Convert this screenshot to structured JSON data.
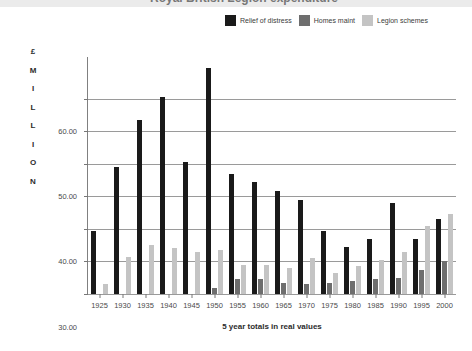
{
  "title": {
    "text": "Royal British Legion expenditure",
    "clipped": true
  },
  "legend": {
    "position": "top-right",
    "items": [
      {
        "label": "Relief of distress",
        "color": "#1a1a1a",
        "swatch_name": "legend-swatch-relief-of-distress"
      },
      {
        "label": "Homes maint",
        "color": "#6e6e6e",
        "swatch_name": "legend-swatch-homes-maint"
      },
      {
        "label": "Legion schemes",
        "color": "#c4c4c4",
        "swatch_name": "legend-swatch-legion-schemes"
      }
    ]
  },
  "y_axis": {
    "caption_letters": [
      "£",
      "M",
      "I",
      "L",
      "L",
      "I",
      "O",
      "N"
    ],
    "caption_text": "£ MILLION",
    "ticks": [
      "60.00",
      "50.00",
      "40.00",
      "30.00",
      "20.00",
      "10.00",
      "0.00"
    ],
    "tick_values": [
      60,
      50,
      40,
      30,
      20,
      10,
      0
    ]
  },
  "x_axis": {
    "title": "5 year totals in real values"
  },
  "chart_data": {
    "type": "bar",
    "title": "Royal British Legion expenditure",
    "subtitle": "",
    "xlabel": "5 year totals in real values",
    "ylabel": "£ MILLION",
    "ylim": [
      0,
      70
    ],
    "ytick_values": [
      0,
      10,
      20,
      30,
      40,
      50,
      60
    ],
    "ytick_labels": [
      "0.00",
      "10.00",
      "20.00",
      "30.00",
      "40.00",
      "50.00",
      "60.00"
    ],
    "grid": "horizontal",
    "legend_position": "top-right",
    "grouping": "grouped",
    "categories": [
      "1925",
      "1930",
      "1935",
      "1940",
      "1945",
      "1950",
      "1955",
      "1960",
      "1965",
      "1970",
      "1975",
      "1980",
      "1985",
      "1990",
      "1995",
      "2000"
    ],
    "series": [
      {
        "name": "Relief of distress",
        "color": "#1a1a1a",
        "values": [
          19.5,
          39.0,
          53.5,
          60.5,
          40.5,
          69.5,
          37.0,
          34.5,
          31.5,
          29.0,
          19.5,
          14.5,
          17.0,
          28.0,
          17.0,
          23.0
        ]
      },
      {
        "name": "Homes maint",
        "color": "#6e6e6e",
        "values": [
          0.0,
          0.0,
          0.0,
          0.0,
          0.0,
          1.8,
          4.5,
          4.5,
          3.5,
          3.0,
          3.5,
          4.0,
          4.5,
          5.0,
          7.5,
          10.0
        ]
      },
      {
        "name": "Legion schemes",
        "color": "#c4c4c4",
        "values": [
          3.0,
          11.5,
          15.0,
          14.0,
          13.0,
          13.5,
          9.0,
          9.0,
          8.0,
          11.0,
          6.5,
          8.5,
          10.5,
          13.0,
          21.0,
          24.5
        ]
      }
    ]
  }
}
